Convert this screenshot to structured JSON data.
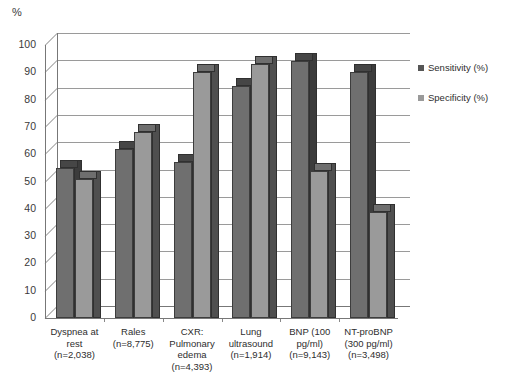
{
  "chart_data": {
    "type": "bar",
    "title": "",
    "subtitle": "",
    "xlabel": "",
    "ylabel": "%",
    "ylim": [
      0,
      100
    ],
    "ytick_step": 10,
    "yticks": [
      "100",
      "90",
      "80",
      "70",
      "60",
      "50",
      "40",
      "30",
      "20",
      "10",
      "0"
    ],
    "grid": true,
    "legend_position": "right",
    "style": "3d-grouped-bar-grayscale",
    "categories": [
      "Dyspnea at rest (n=2,038)",
      "Rales (n=8,775)",
      "CXR: Pulmonary edema (n=4,393)",
      "Lung ultrasound (n=1,914)",
      "BNP (100 pg/ml) (n=9,143)",
      "NT-proBNP (300 pg/ml) (n=3,498)"
    ],
    "category_lines": [
      [
        "Dyspnea at",
        "rest",
        "(n=2,038)"
      ],
      [
        "Rales",
        "(n=8,775)"
      ],
      [
        "CXR:",
        "Pulmonary",
        "edema",
        "(n=4,393)"
      ],
      [
        "Lung",
        "ultrasound",
        "(n=1,914)"
      ],
      [
        "BNP (100",
        "pg/ml)",
        "(n=9,143)"
      ],
      [
        "NT-proBNP",
        "(300 pg/ml)",
        "(n=3,498)"
      ]
    ],
    "series": [
      {
        "name": "Sensitivity (%)",
        "color": "#6f6f6f",
        "values": [
          55,
          62,
          57,
          85,
          94,
          90
        ]
      },
      {
        "name": "Specificity (%)",
        "color": "#9a9a9a",
        "values": [
          51,
          68,
          90,
          93,
          54,
          39
        ]
      }
    ]
  },
  "legend": {
    "items": [
      {
        "label": "Sensitivity (%)"
      },
      {
        "label": "Specificity (%)"
      }
    ]
  }
}
